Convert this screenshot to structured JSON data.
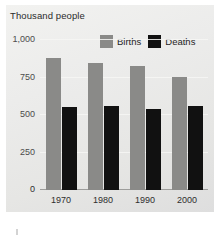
{
  "chart_data": {
    "type": "bar",
    "title": "",
    "subtitle": "",
    "xlabel": "",
    "ylabel": "Thousand people",
    "categories": [
      "1970",
      "1980",
      "1990",
      "2000"
    ],
    "series": [
      {
        "name": "Births",
        "color": "#8a8a88",
        "values": [
          880,
          850,
          825,
          755
        ]
      },
      {
        "name": "Deaths",
        "color": "#111111",
        "values": [
          555,
          560,
          540,
          560
        ]
      }
    ],
    "ylim": [
      0,
      1000
    ],
    "yticks": [
      0,
      250,
      500,
      750,
      1000
    ],
    "ytick_labels": [
      "0",
      "250",
      "500",
      "750",
      "1,000"
    ],
    "grid": true,
    "grid_axis": "y",
    "legend_position": "top-right"
  },
  "legend": {
    "items": [
      {
        "label": "Births",
        "color": "#8a8a88"
      },
      {
        "label": "Deaths",
        "color": "#111111"
      }
    ]
  },
  "panel": {
    "background_start": "#f2f2f0",
    "background_end": "#dedede"
  }
}
